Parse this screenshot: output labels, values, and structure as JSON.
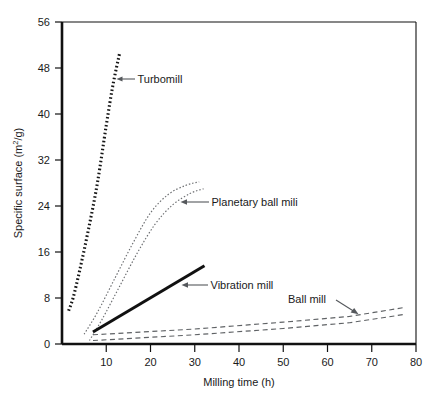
{
  "figure": {
    "title": "",
    "background": "#ffffff",
    "width": 437,
    "height": 399
  },
  "chart_data": {
    "type": "line",
    "title": "",
    "subtitle": "",
    "xlabel": "Milling time (h)",
    "ylabel": "Specific surface (m2/g)",
    "ylabel_display": "Specific surface (m²/g)",
    "xlim": [
      0,
      80
    ],
    "ylim": [
      0,
      56
    ],
    "xticks": [
      0,
      10,
      20,
      30,
      40,
      50,
      60,
      70,
      80
    ],
    "xticklabels": [
      "0",
      "10",
      "20",
      "30",
      "40",
      "50",
      "60",
      "70",
      "80"
    ],
    "yticks": [
      0,
      8,
      16,
      24,
      32,
      40,
      48,
      56
    ],
    "yticklabels": [
      "0",
      "8",
      "16",
      "24",
      "32",
      "40",
      "48",
      "56"
    ],
    "grid": false,
    "legend": "none (inline annotations with arrows)",
    "series": [
      {
        "name": "Turbomill",
        "style": "thick dotted",
        "color": "#161616",
        "x": [
          1.5,
          2.5,
          4.0,
          6.0,
          8.0,
          10.0,
          11.5,
          13.0
        ],
        "values": [
          5.8,
          8.0,
          12.8,
          20.0,
          28.0,
          38.0,
          45.0,
          50.5
        ]
      },
      {
        "name": "Planetary ball mili upper",
        "style": "thin dotted",
        "color": "#6d6f72",
        "x": [
          5.0,
          8.0,
          12.0,
          16.0,
          20.0,
          24.0,
          28.0,
          31.0
        ],
        "values": [
          1.7,
          5.5,
          11.5,
          17.5,
          22.8,
          26.0,
          27.6,
          28.2
        ]
      },
      {
        "name": "Planetary ball mili lower",
        "style": "thin dotted",
        "color": "#6d6f72",
        "x": [
          6.2,
          9.0,
          13.0,
          17.0,
          21.0,
          25.0,
          29.0,
          32.0
        ],
        "values": [
          0.6,
          4.2,
          10.0,
          15.8,
          20.8,
          24.2,
          26.2,
          27.0
        ]
      },
      {
        "name": "Vibration mill",
        "style": "thick solid",
        "color": "#111111",
        "x": [
          7.0,
          32.2
        ],
        "values": [
          2.1,
          13.6
        ]
      },
      {
        "name": "Ball mill upper",
        "style": "thin dashed",
        "color": "#5f6265",
        "x": [
          7.0,
          30.0,
          50.0,
          65.0,
          77.0
        ],
        "values": [
          1.6,
          2.6,
          3.8,
          4.8,
          6.3
        ]
      },
      {
        "name": "Ball mill lower",
        "style": "thin dashed",
        "color": "#5f6265",
        "x": [
          7.0,
          30.0,
          50.0,
          65.0,
          77.0
        ],
        "values": [
          0.6,
          1.6,
          2.7,
          3.7,
          5.1
        ]
      }
    ],
    "annotations": [
      {
        "label": "Turbomill",
        "text_x": 13.6,
        "text_y": 46.0,
        "arrow_to_x": 11.9,
        "arrow_to_y": 47.0
      },
      {
        "label": "Planetary ball mili",
        "text_x": 33.0,
        "text_y": 24.4,
        "arrow_to_x": 26.2,
        "arrow_to_y": 24.6
      },
      {
        "label": "Vibration mill",
        "text_x": 34.0,
        "text_y": 10.3,
        "arrow_to_x": 27.3,
        "arrow_to_y": 10.4
      },
      {
        "label": "Ball mill",
        "text_x": 54.5,
        "text_y": 7.9,
        "arrow_to_x": 65.0,
        "arrow_to_y": 5.2
      }
    ]
  }
}
